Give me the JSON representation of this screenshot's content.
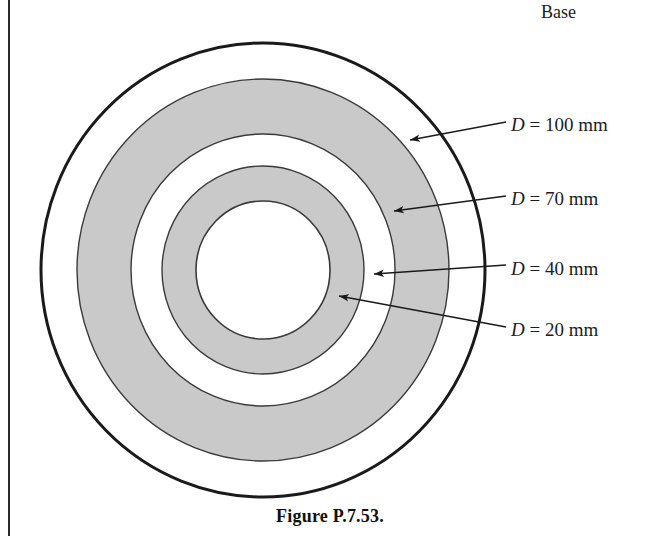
{
  "figure": {
    "caption": "Figure P.7.53.",
    "base_label": "Base",
    "colors": {
      "ring_fill": "#c9c9c9",
      "background": "#ffffff",
      "outline": "#1a1a1a",
      "thin_outline": "#3a3a3a",
      "text": "#1c1c1c"
    },
    "annotations": [
      {
        "symbol": "D",
        "relation": "=",
        "value": "100",
        "unit": "mm",
        "text": "D = 100 mm"
      },
      {
        "symbol": "D",
        "relation": "=",
        "value": "70",
        "unit": "mm",
        "text": "D = 70 mm"
      },
      {
        "symbol": "D",
        "relation": "=",
        "value": "40",
        "unit": "mm",
        "text": "D = 40 mm"
      },
      {
        "symbol": "D",
        "relation": "=",
        "value": "20",
        "unit": "mm",
        "text": "D = 20 mm"
      }
    ]
  },
  "chart_data": {
    "type": "diagram",
    "subtype": "concentric-annular-fin-cross-section",
    "title": "Figure P.7.53.",
    "center": {
      "x": 263,
      "y": 270
    },
    "rings": [
      {
        "label": "D = 100 mm",
        "diameter_mm": 100,
        "pixel_radius_x": 222,
        "pixel_radius_y": 227,
        "fill": "#ffffff",
        "stroke": "#1a1a1a",
        "stroke_width": 3
      },
      {
        "label": "D = 70 mm",
        "diameter_mm": 70,
        "pixel_radius_x": 186,
        "pixel_radius_y": 191,
        "fill": "#c9c9c9",
        "stroke": "#3a3a3a",
        "stroke_width": 1.4
      },
      {
        "label": "D = 40 mm",
        "diameter_mm": 40,
        "pixel_radius_x": 132,
        "pixel_radius_y": 136,
        "fill": "#ffffff",
        "stroke": "#3a3a3a",
        "stroke_width": 1.4
      },
      {
        "label": "D = 20 mm",
        "diameter_mm": 20,
        "pixel_radius_x": 101,
        "pixel_radius_y": 104,
        "fill": "#c9c9c9",
        "stroke": "#3a3a3a",
        "stroke_width": 1.4
      },
      {
        "label": "inner-bore",
        "diameter_mm": null,
        "pixel_radius_x": 67,
        "pixel_radius_y": 69,
        "fill": "#ffffff",
        "stroke": "#3a3a3a",
        "stroke_width": 1.6
      }
    ],
    "leaders": [
      {
        "label": "D = 100 mm",
        "tip": {
          "x": 406,
          "y": 141
        },
        "tail": {
          "x": 506,
          "y": 122
        }
      },
      {
        "label": "D = 70 mm",
        "tip": {
          "x": 389,
          "y": 212
        },
        "tail": {
          "x": 506,
          "y": 196
        }
      },
      {
        "label": "D = 40 mm",
        "tip": {
          "x": 369,
          "y": 274
        },
        "tail": {
          "x": 506,
          "y": 265
        }
      },
      {
        "label": "D = 20 mm",
        "tip": {
          "x": 334,
          "y": 295
        },
        "tail": {
          "x": 506,
          "y": 327
        }
      }
    ],
    "axis_labels": {
      "top_right": "Base"
    },
    "grid": false,
    "legend": "none"
  }
}
